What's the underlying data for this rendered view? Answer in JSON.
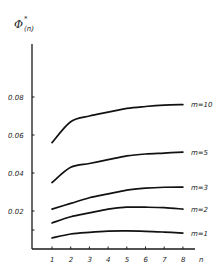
{
  "chart_data": {
    "type": "line",
    "title": "",
    "xlabel": "n",
    "ylabel": "Φ*(n)",
    "ylabel_main": "Φ",
    "ylabel_sup": "*",
    "ylabel_sub": "(n)",
    "x": [
      1,
      2,
      3,
      4,
      5,
      6,
      7,
      8
    ],
    "x_tick_labels": [
      "1",
      "2",
      "3",
      "4",
      "5",
      "6",
      "7",
      "8"
    ],
    "y_ticks": [
      0.01,
      0.02,
      0.04,
      0.06,
      0.08
    ],
    "y_tick_labels": [
      "",
      "0.02",
      "0.04",
      "0.06",
      "0.08"
    ],
    "xlim": [
      0.3,
      8.7
    ],
    "ylim": [
      0,
      0.108
    ],
    "grid": false,
    "legend": "inline labels at right end of each curve",
    "series": [
      {
        "name": "m=10",
        "values": [
          0.056,
          0.067,
          0.07,
          0.072,
          0.074,
          0.075,
          0.0757,
          0.076
        ]
      },
      {
        "name": "m=5",
        "values": [
          0.035,
          0.043,
          0.045,
          0.047,
          0.049,
          0.05,
          0.0505,
          0.051
        ]
      },
      {
        "name": "m=3",
        "values": [
          0.021,
          0.024,
          0.027,
          0.029,
          0.031,
          0.032,
          0.0325,
          0.0326
        ]
      },
      {
        "name": "m=2",
        "values": [
          0.0137,
          0.017,
          0.019,
          0.021,
          0.022,
          0.022,
          0.0218,
          0.021
        ]
      },
      {
        "name": "m=1",
        "values": [
          0.0058,
          0.0079,
          0.0088,
          0.0094,
          0.0095,
          0.0093,
          0.0089,
          0.0084
        ]
      }
    ]
  },
  "layout": {
    "x0_px": 52,
    "dx_px": 18.7,
    "y0_px": 249,
    "px_per_unit": 1900
  }
}
